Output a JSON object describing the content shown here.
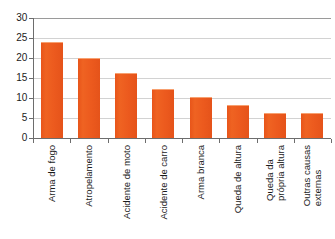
{
  "chart_data": {
    "type": "bar",
    "title": "",
    "subtitle": "",
    "xlabel": "",
    "ylabel": "",
    "ylim": [
      0,
      30
    ],
    "yticks": [
      0,
      5,
      10,
      15,
      20,
      25,
      30
    ],
    "ytick_labels": [
      "0",
      "5",
      "10",
      "15",
      "20",
      "25",
      "30"
    ],
    "grid": true,
    "legend": false,
    "legend_position": "none",
    "bar_color": "#ec5a1e",
    "gridline_color": "#d2d2d2",
    "axis_color": "#6d6d6d",
    "background_color": "#ffffff",
    "categories": [
      "Arma de fogo",
      "Atropelamento",
      "Acidente de moto",
      "Acidente de carro",
      "Arma branca",
      "Queda de altura",
      "Queda da própria altura",
      "Outras causas externas"
    ],
    "category_lines": [
      [
        "Arma de fogo"
      ],
      [
        "Atropelamento"
      ],
      [
        "Acidente de moto"
      ],
      [
        "Acidente de carro"
      ],
      [
        "Arma branca"
      ],
      [
        "Queda de altura"
      ],
      [
        "Queda da",
        "própria altura"
      ],
      [
        "Outras causas",
        "externas"
      ]
    ],
    "values": [
      24.0,
      20.0,
      16.2,
      12.2,
      10.3,
      8.2,
      6.3,
      6.3
    ]
  }
}
